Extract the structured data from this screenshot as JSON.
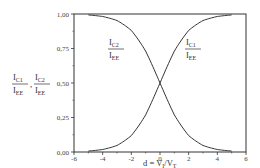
{
  "chart_data": {
    "type": "line",
    "title": "",
    "xlabel": "d = V_I/V_T",
    "ylabel": "I_C1/I_EE , I_C2/I_EE",
    "xlim": [
      -6,
      6
    ],
    "ylim": [
      0,
      1
    ],
    "xticks": [
      -6,
      -4,
      -2,
      0,
      2,
      4,
      6
    ],
    "xtick_labels": [
      "-6",
      "-4",
      "-2",
      "0",
      "2",
      "4",
      "6"
    ],
    "yticks": [
      0,
      0.25,
      0.5,
      0.75,
      1.0
    ],
    "ytick_labels": [
      "0,00",
      "0,25",
      "0,50",
      "0,75",
      "1,00"
    ],
    "grid": false,
    "legend": "none (inline curve labels)",
    "x": [
      -5,
      -4,
      -3,
      -2,
      -1,
      0,
      1,
      2,
      3,
      4,
      5
    ],
    "series": [
      {
        "name": "I_C1/I_EE",
        "values": [
          0.007,
          0.018,
          0.047,
          0.119,
          0.269,
          0.5,
          0.731,
          0.881,
          0.953,
          0.982,
          0.993
        ]
      },
      {
        "name": "I_C2/I_EE",
        "values": [
          0.993,
          0.982,
          0.953,
          0.881,
          0.731,
          0.5,
          0.269,
          0.119,
          0.047,
          0.018,
          0.007
        ]
      }
    ],
    "annotations": [
      {
        "text": "I_C2/I_EE",
        "x": -2.8,
        "y": 0.78
      },
      {
        "text": "I_C1/I_EE",
        "x": 2.3,
        "y": 0.78
      }
    ]
  },
  "labels": {
    "ylabel_c1_main": "I",
    "ylabel_c1_sub": "C1",
    "ylabel_c2_main": "I",
    "ylabel_c2_sub": "C2",
    "ylabel_ee_main": "I",
    "ylabel_ee_sub": "EE",
    "ylabel_sep": ",",
    "xlabel_main": "d = V",
    "xlabel_sub1": "I",
    "xlabel_mid": "/V",
    "xlabel_sub2": "T"
  }
}
